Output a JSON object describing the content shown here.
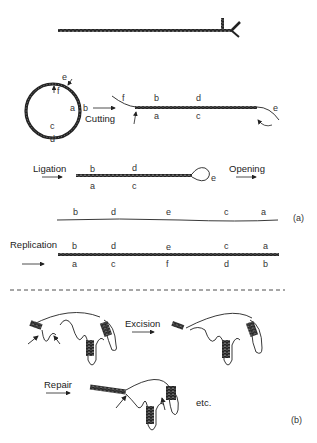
{
  "part_a": {
    "panel_label": "(a)",
    "circle_labels": {
      "e": "e",
      "f": "f",
      "a": "a",
      "b": "b",
      "c": "c",
      "d": "d"
    },
    "step1": {
      "arrow_label": "Cutting",
      "top": [
        "f",
        "b",
        "d",
        "e"
      ],
      "bottom": [
        "a",
        "c"
      ]
    },
    "step2": {
      "arrow_label": "Ligation",
      "top": [
        "b",
        "d"
      ],
      "bottom": [
        "a",
        "c"
      ],
      "loop": "e",
      "next_label": "Opening"
    },
    "step3": {
      "top": [
        "b",
        "d",
        "e",
        "c",
        "a"
      ]
    },
    "step4": {
      "arrow_label": "Replication",
      "top": [
        "b",
        "d",
        "e",
        "c",
        "a"
      ],
      "bottom": [
        "a",
        "c",
        "f",
        "d",
        "b"
      ]
    }
  },
  "part_b": {
    "panel_label": "(b)",
    "excision_label": "Excision",
    "repair_label": "Repair",
    "etc_label": "etc."
  },
  "colors": {
    "strand": "#333333",
    "line": "#222222"
  }
}
